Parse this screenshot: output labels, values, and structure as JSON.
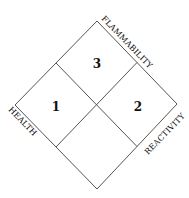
{
  "diagram": {
    "type": "hazard-diamond",
    "quadrants": {
      "top": {
        "value": "3"
      },
      "left": {
        "value": "1"
      },
      "right": {
        "value": "2"
      },
      "bottom": {
        "value": ""
      }
    },
    "labels": {
      "top_right_edge": "FLAMMABILITY",
      "left_edge": "HEALTH",
      "right_edge": "REACTIVITY"
    },
    "colors": {
      "line": "#555555",
      "text": "#111111"
    }
  }
}
